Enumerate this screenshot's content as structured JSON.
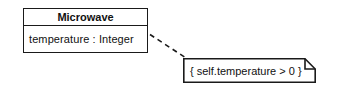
{
  "diagram": {
    "type": "uml-class-diagram",
    "background_color": "#ffffff",
    "line_color": "#1a1a1a",
    "text_color": "#111111",
    "class": {
      "name": "Microwave",
      "attributes": [
        "temperature : Integer"
      ]
    },
    "note": {
      "text": "{ self.temperature > 0 }",
      "kind": "constraint-note",
      "fold_corner": "top-right"
    },
    "connector": {
      "style": "dashed",
      "from": "class-box-right-edge",
      "to": "note-box-top-left"
    }
  }
}
